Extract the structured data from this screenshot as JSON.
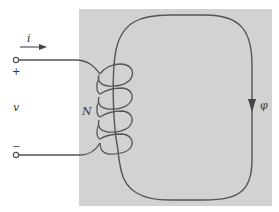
{
  "diagram": {
    "type": "magnetic-circuit",
    "core_color": "#d2d2d2",
    "wire_color": "#555555",
    "labels": {
      "current": "i",
      "voltage": "v",
      "turns": "N",
      "flux": "φ",
      "plus": "+",
      "minus": "−"
    }
  }
}
